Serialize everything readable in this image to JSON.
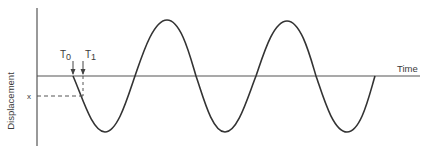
{
  "diagram": {
    "type": "waveform",
    "y_axis_label": "Displacement",
    "x_axis_label": "Time",
    "level_marker": "x",
    "markers": [
      {
        "label": "T",
        "sub": "0"
      },
      {
        "label": "T",
        "sub": "1"
      }
    ],
    "colors": {
      "line": "#3a3a3a",
      "axis": "#555555",
      "background": "#ffffff"
    }
  }
}
